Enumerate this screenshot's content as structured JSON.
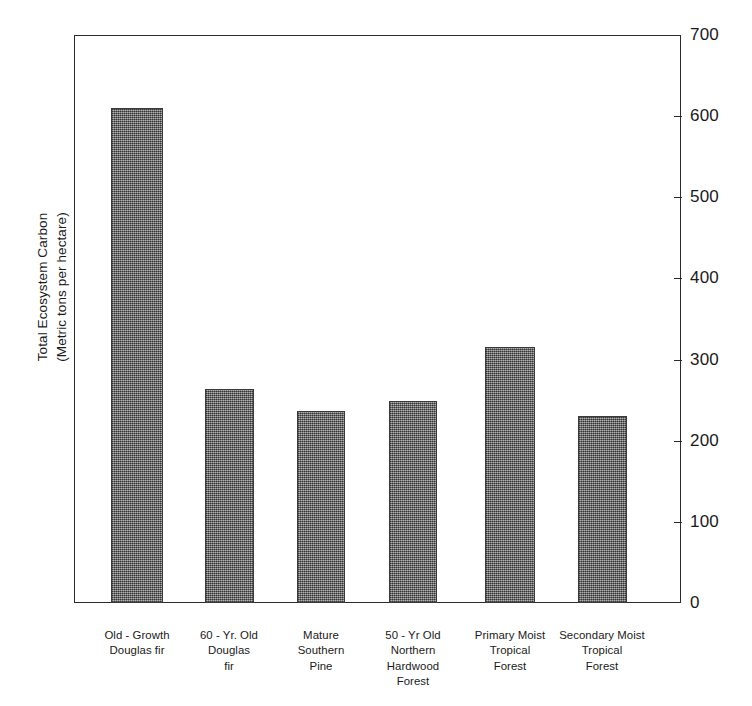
{
  "chart_data": {
    "type": "bar",
    "title": "",
    "subtitle": "",
    "xlabel": "",
    "ylabel": "Total Ecosystem Carbon\n(Metric tons per hectare)",
    "ylabel_line1": "Total Ecosystem Carbon",
    "ylabel_line2": "(Metric tons per hectare)",
    "ylim": [
      0,
      700
    ],
    "ytick_values": [
      0,
      100,
      200,
      300,
      400,
      500,
      600,
      700
    ],
    "ytick_labels": [
      "0",
      "100",
      "200",
      "300",
      "400",
      "500",
      "600",
      "700"
    ],
    "yaxis_position": "right",
    "grid": false,
    "legend": null,
    "categories": [
      "Old - Growth\nDouglas fir",
      "60 - Yr. Old\nDouglas\nfir",
      "Mature\nSouthern\nPine",
      "50 - Yr Old\nNorthern\nHardwood\nForest",
      "Primary Moist\nTropical\nForest",
      "Secondary Moist\nTropical\nForest"
    ],
    "values": [
      610,
      264,
      237,
      249,
      315,
      230
    ],
    "bar_color": "#6e6e6e",
    "bar_edge_color": "#3a3a3a",
    "axis_color": "#2b2b2b",
    "background_color": "#ffffff",
    "bars": [
      {
        "label": "Old - Growth\nDouglas fir",
        "value": 610,
        "center_px": 137,
        "width_px": 52
      },
      {
        "label": "60 - Yr. Old\nDouglas\nfir",
        "value": 264,
        "center_px": 229,
        "width_px": 49
      },
      {
        "label": "Mature\nSouthern\nPine",
        "value": 237,
        "center_px": 321,
        "width_px": 48
      },
      {
        "label": "50 - Yr Old\nNorthern\nHardwood\nForest",
        "value": 249,
        "center_px": 413,
        "width_px": 48
      },
      {
        "label": "Primary Moist\nTropical\nForest",
        "value": 315,
        "center_px": 510,
        "width_px": 50
      },
      {
        "label": "Secondary Moist\nTropical\nForest",
        "value": 230,
        "center_px": 602,
        "width_px": 49
      }
    ]
  }
}
